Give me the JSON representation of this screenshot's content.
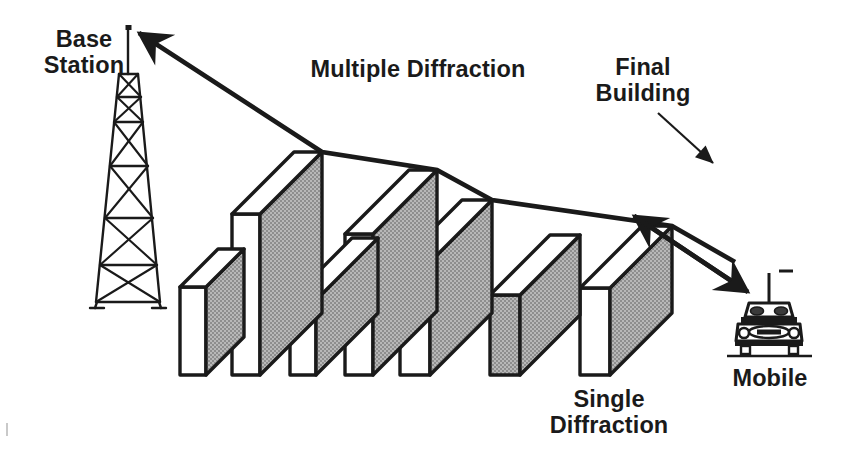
{
  "figure": {
    "type": "diagram",
    "background_color": "#ffffff",
    "ink_color": "#1a1a1a",
    "building_face_color": "#a3a3a3",
    "building_top_color": "#ffffff"
  },
  "labels": {
    "base_station": "Base\nStation",
    "multiple_diffraction": "Multiple Diffraction",
    "final_building": "Final\nBuilding",
    "single_diffraction": "Single\nDiffraction",
    "mobile": "Mobile"
  },
  "elements": {
    "tower_name": "base-station-tower",
    "tower_sections": 5,
    "buildings_count": 7,
    "car_name": "mobile-vehicle",
    "ray_name": "multiple-diffraction-ray",
    "final_ray_name": "single-diffraction-ray"
  },
  "geometry": {
    "baseline_y": 375,
    "tower_top": {
      "x": 128,
      "y": 27
    },
    "ray_endpoint_right": {
      "x": 735,
      "y": 262
    },
    "buildings": [
      {
        "index": 1,
        "front_x": 180,
        "top_y": 287,
        "width": 26,
        "depth": 38
      },
      {
        "index": 2,
        "front_x": 232,
        "top_y": 214,
        "width": 28,
        "depth": 96
      },
      {
        "index": 3,
        "front_x": 290,
        "top_y": 300,
        "width": 26,
        "depth": 80
      },
      {
        "index": 4,
        "front_x": 345,
        "top_y": 234,
        "width": 28,
        "depth": 92
      },
      {
        "index": 5,
        "front_x": 400,
        "top_y": 262,
        "width": 30,
        "depth": 92
      },
      {
        "index": 6,
        "front_x": 490,
        "top_y": 295,
        "width": 30,
        "depth": 86
      },
      {
        "index": 7,
        "front_x": 580,
        "top_y": 288,
        "width": 30,
        "depth": 88
      }
    ]
  }
}
